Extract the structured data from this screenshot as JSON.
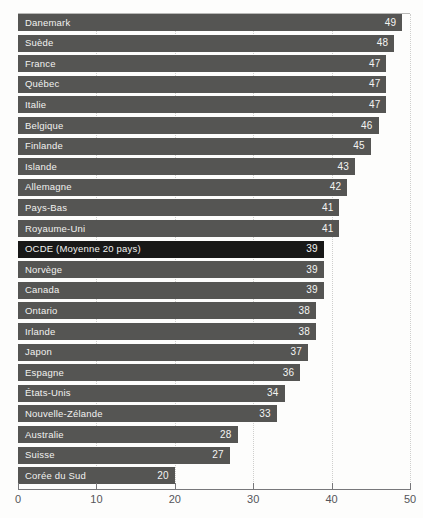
{
  "chart_data": {
    "type": "bar",
    "orientation": "horizontal",
    "title": "",
    "subtitle": "",
    "xlabel": "",
    "ylabel": "",
    "xlim": [
      0,
      50
    ],
    "xticks": [
      0,
      10,
      20,
      30,
      40,
      50
    ],
    "xtick_labels": [
      "0",
      "10",
      "20",
      "30",
      "40",
      "50"
    ],
    "grid": "vertical-dotted",
    "legend": "none",
    "highlight_category": "OCDE (Moyenne 20 pays)",
    "colors": {
      "bar": "#555553",
      "bar_highlight": "#181817",
      "value_text": "#f4f4f2",
      "label_text": "#f2f2f0",
      "axis": "#77777a",
      "gridline": "#cfcfcd",
      "background": "#fdfdfc",
      "tick_label": "#55555a"
    },
    "categories": [
      "Danemark",
      "Suède",
      "France",
      "Québec",
      "Italie",
      "Belgique",
      "Finlande",
      "Islande",
      "Allemagne",
      "Pays-Bas",
      "Royaume-Uni",
      "OCDE (Moyenne 20 pays)",
      "Norvège",
      "Canada",
      "Ontario",
      "Irlande",
      "Japon",
      "Espagne",
      "États-Unis",
      "Nouvelle-Zélande",
      "Australie",
      "Suisse",
      "Corée du Sud"
    ],
    "values": [
      49,
      48,
      47,
      47,
      47,
      46,
      45,
      43,
      42,
      41,
      41,
      39,
      39,
      39,
      38,
      38,
      37,
      36,
      34,
      33,
      28,
      27,
      20
    ],
    "value_labels": [
      "49",
      "48",
      "47",
      "47",
      "47",
      "46",
      "45",
      "43",
      "42",
      "41",
      "41",
      "39",
      "39",
      "39",
      "38",
      "38",
      "37",
      "36",
      "34",
      "33",
      "28",
      "27",
      "20"
    ]
  }
}
